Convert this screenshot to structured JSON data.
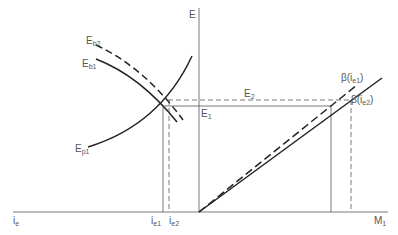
{
  "diagram": {
    "axes": {
      "vertical_label": "E",
      "horizontal_left_label": "i",
      "horizontal_left_sub": "e",
      "horizontal_right_label": "M",
      "horizontal_right_sub": "1"
    },
    "curves": {
      "eb2": {
        "label": "E",
        "sub": "b2",
        "style": "dashed"
      },
      "eb1": {
        "label": "E",
        "sub": "b1",
        "style": "solid"
      },
      "ep1": {
        "label": "E",
        "sub": "p1",
        "style": "solid"
      }
    },
    "levels": {
      "e1": {
        "label": "E",
        "sub": "1",
        "style": "solid"
      },
      "e2": {
        "label": "E",
        "sub": "2",
        "style": "dashed"
      }
    },
    "ticks": {
      "ie1": {
        "label": "i",
        "sub": "e1"
      },
      "ie2": {
        "label": "i",
        "sub": "e2"
      }
    },
    "rays": {
      "beta1": {
        "label_pre": "β(i",
        "sub": "e1",
        "label_post": ")",
        "style": "dashed"
      },
      "beta2": {
        "label_pre": "β(i",
        "sub": "e2",
        "label_post": ")",
        "style": "solid"
      }
    },
    "colors": {
      "line": "#222222",
      "thin": "#555555",
      "text": "#555555"
    }
  }
}
